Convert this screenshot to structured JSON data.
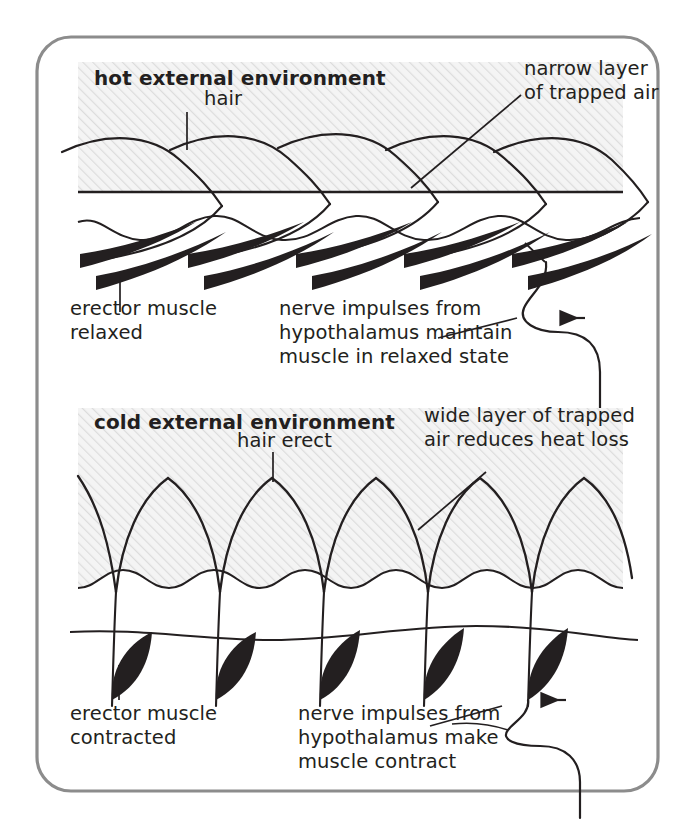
{
  "figure": {
    "border_color": "#8c8c8c",
    "hatch_fill": "#f2f2f2",
    "hatch_line": "#d9d9d9",
    "ink": "#231f20"
  },
  "panels": [
    {
      "id": "hot",
      "heading": "hot external environment",
      "labels": {
        "hair": "hair",
        "trapped_air_line1": "narrow layer",
        "trapped_air_line2": "of trapped air",
        "muscle_line1": "erector muscle",
        "muscle_line2": "relaxed",
        "nerve_line1": "nerve impulses from",
        "nerve_line2": "hypothalamus maintain",
        "nerve_line3": "muscle in relaxed state"
      }
    },
    {
      "id": "cold",
      "heading": "cold external environment",
      "labels": {
        "hair": "hair erect",
        "trapped_air_line1": "wide layer of trapped",
        "trapped_air_line2": "air reduces heat loss",
        "muscle_line1": "erector muscle",
        "muscle_line2": "contracted",
        "nerve_line1": "nerve impulses from",
        "nerve_line2": "hypothalamus make",
        "nerve_line3": "muscle contract"
      }
    }
  ],
  "icons": {
    "nerve_arrowhead": "arrow-left-icon"
  }
}
